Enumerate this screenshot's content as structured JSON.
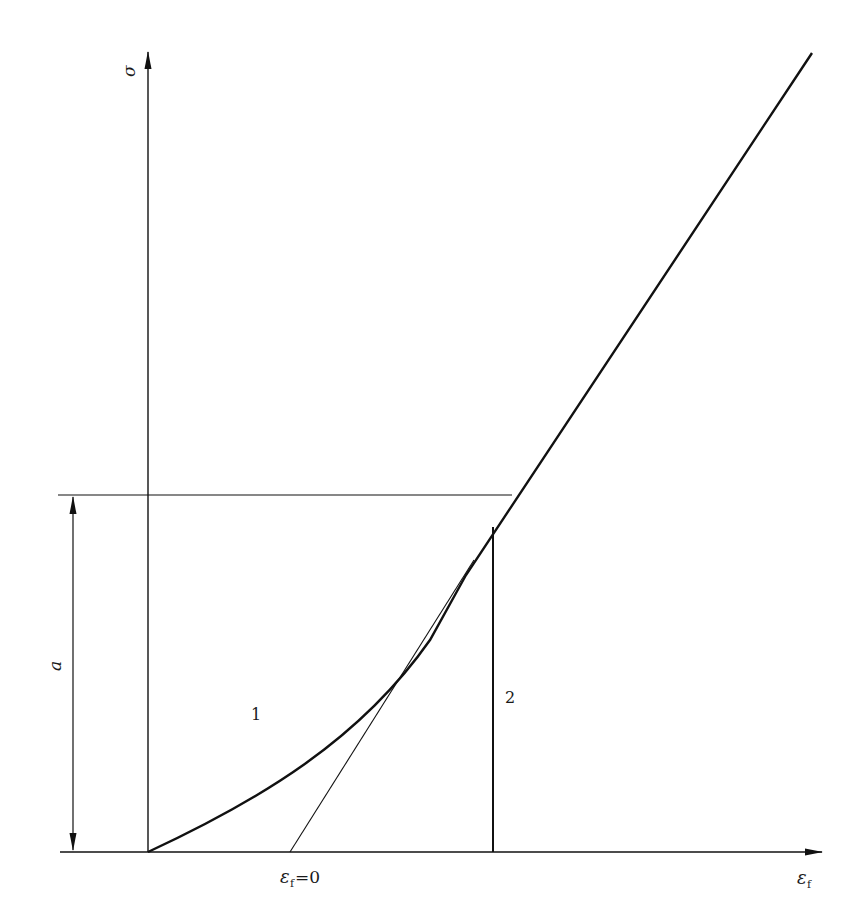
{
  "diagram": {
    "y_axis_label": "σ",
    "x_axis_label_main": "ε",
    "x_axis_label_sub": "f",
    "intercept_label_main": "ε",
    "intercept_label_sub": "f",
    "intercept_label_eq": "=0",
    "dimension_label": "a",
    "curve_label_1": "1",
    "curve_label_2": "2",
    "colors": {
      "line": "#111111",
      "background": "#ffffff"
    }
  }
}
